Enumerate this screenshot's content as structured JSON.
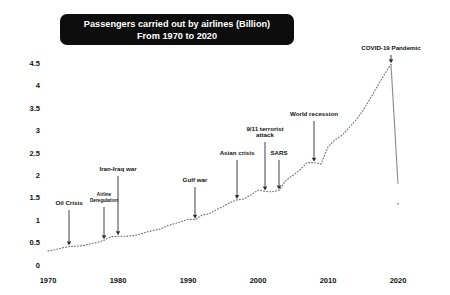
{
  "title": {
    "line1": "Passengers carried out by airlines (Billion)",
    "line2": "From 1970 to 2020",
    "background_color": "#0d0d0d",
    "text_color": "#ffffff"
  },
  "axes": {
    "y_ticks": [
      "0",
      "0.5",
      "1",
      "1.5",
      "2",
      "2.5",
      "3",
      "3.5",
      "4",
      "4.5"
    ],
    "x_ticks": [
      "1970",
      "1980",
      "1990",
      "2000",
      "2010",
      "2020"
    ]
  },
  "annotations": [
    {
      "id": "oil-crisis",
      "label": "Oil Crisis",
      "label2": "",
      "year": 1973
    },
    {
      "id": "airline-deregulation",
      "label": "Airline",
      "label2": "Deregulation",
      "year": 1978
    },
    {
      "id": "iran-iraq-war",
      "label": "Iran-Iraq war",
      "label2": "",
      "year": 1980
    },
    {
      "id": "gulf-war",
      "label": "Gulf war",
      "label2": "",
      "year": 1991
    },
    {
      "id": "asian-crisis",
      "label": "Asian crisis",
      "label2": "",
      "year": 1997
    },
    {
      "id": "9-11-terrorist-attack",
      "label": "9/11 terrorist",
      "label2": "attack",
      "year": 2001
    },
    {
      "id": "sars",
      "label": "SARS",
      "label2": "",
      "year": 2003
    },
    {
      "id": "world-recession",
      "label": "World recession",
      "label2": "",
      "year": 2008
    },
    {
      "id": "covid-19-pandemic",
      "label": "COVID-19 Pandemic",
      "label2": "",
      "year": 2019
    }
  ],
  "chart_data": {
    "type": "line",
    "title": "Passengers carried out by airlines (Billion) From 1970 to 2020",
    "xlabel": "",
    "ylabel": "Passengers (Billion)",
    "xlim": [
      1970,
      2020
    ],
    "ylim": [
      0,
      4.7
    ],
    "grid": false,
    "legend": "none",
    "line_style": "dotted",
    "line_color": "#6e6e6e",
    "x": [
      1970,
      1971,
      1972,
      1973,
      1974,
      1975,
      1976,
      1977,
      1978,
      1979,
      1980,
      1981,
      1982,
      1983,
      1984,
      1985,
      1986,
      1987,
      1988,
      1989,
      1990,
      1991,
      1992,
      1993,
      1994,
      1995,
      1996,
      1997,
      1998,
      1999,
      2000,
      2001,
      2002,
      2003,
      2004,
      2005,
      2006,
      2007,
      2008,
      2009,
      2010,
      2011,
      2012,
      2013,
      2014,
      2015,
      2016,
      2017,
      2018,
      2019,
      2020
    ],
    "values": [
      0.31,
      0.34,
      0.38,
      0.41,
      0.42,
      0.43,
      0.47,
      0.5,
      0.55,
      0.63,
      0.64,
      0.64,
      0.65,
      0.68,
      0.73,
      0.77,
      0.8,
      0.87,
      0.92,
      0.96,
      1.02,
      1.01,
      1.11,
      1.14,
      1.23,
      1.3,
      1.39,
      1.45,
      1.47,
      1.56,
      1.67,
      1.64,
      1.63,
      1.66,
      1.89,
      2.0,
      2.12,
      2.28,
      2.28,
      2.25,
      2.63,
      2.79,
      2.89,
      3.06,
      3.23,
      3.44,
      3.7,
      3.97,
      4.23,
      4.47,
      1.81
    ],
    "annotation_points": [
      {
        "label": "Oil Crisis",
        "year": 1973,
        "value": 0.41
      },
      {
        "label": "Airline Deregulation",
        "year": 1978,
        "value": 0.55
      },
      {
        "label": "Iran-Iraq war",
        "year": 1980,
        "value": 0.64
      },
      {
        "label": "Gulf war",
        "year": 1991,
        "value": 1.01
      },
      {
        "label": "Asian crisis",
        "year": 1997,
        "value": 1.45
      },
      {
        "label": "9/11 terrorist attack",
        "year": 2001,
        "value": 1.64
      },
      {
        "label": "SARS",
        "year": 2003,
        "value": 1.66
      },
      {
        "label": "World recession",
        "year": 2008,
        "value": 2.28
      },
      {
        "label": "COVID-19 Pandemic",
        "year": 2019,
        "value": 4.47
      }
    ]
  }
}
